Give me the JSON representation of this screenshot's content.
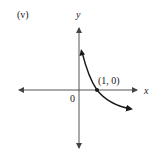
{
  "figure": {
    "panel_label": "(v)",
    "x_axis_label": "x",
    "y_axis_label": "y",
    "origin_label": "0",
    "point_label": "(1, 0)",
    "curve": {
      "description": "decreasing curve crossing x-axis at (1, 0), approaching y-axis asymptotically",
      "point": {
        "x": 1,
        "y": 0
      }
    },
    "colors": {
      "axis": "#555555",
      "curve": "#1a1a1a",
      "text": "#1a1a1a"
    }
  }
}
